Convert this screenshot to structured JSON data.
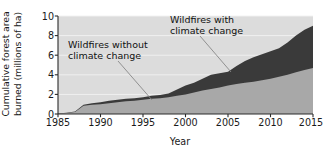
{
  "chart_data": {
    "type": "area",
    "title": "",
    "xlabel": "Year",
    "ylabel": "Cumulative forest area burned (millions of ha)",
    "xlim": [
      1985,
      2015
    ],
    "ylim": [
      0,
      10
    ],
    "xticks": [
      1985,
      1990,
      1995,
      2000,
      2005,
      2010,
      2015
    ],
    "yticks": [
      0,
      2,
      4,
      6,
      8,
      10
    ],
    "grid": true,
    "grid_orientation": "horizontal",
    "stacked": true,
    "legend_position": "annotations-inline",
    "x": [
      1985,
      1986,
      1987,
      1988,
      1989,
      1990,
      1991,
      1992,
      1993,
      1994,
      1995,
      1996,
      1997,
      1998,
      1999,
      2000,
      2001,
      2002,
      2003,
      2004,
      2005,
      2006,
      2007,
      2008,
      2009,
      2010,
      2011,
      2012,
      2013,
      2014,
      2015
    ],
    "series": [
      {
        "name": "Wildfires without climate change",
        "color": "#a8a8a8",
        "values": [
          0.05,
          0.1,
          0.2,
          0.85,
          0.95,
          1.0,
          1.1,
          1.2,
          1.3,
          1.35,
          1.45,
          1.55,
          1.6,
          1.7,
          1.85,
          2.0,
          2.2,
          2.4,
          2.55,
          2.7,
          2.9,
          3.05,
          3.2,
          3.3,
          3.45,
          3.6,
          3.8,
          4.0,
          4.25,
          4.5,
          4.7
        ]
      },
      {
        "name": "Wildfires with climate change",
        "color": "#3a3a3a",
        "values": [
          0.05,
          0.12,
          0.25,
          0.95,
          1.1,
          1.2,
          1.35,
          1.45,
          1.55,
          1.6,
          1.7,
          1.85,
          1.95,
          2.1,
          2.5,
          2.9,
          3.2,
          3.6,
          4.0,
          4.15,
          4.3,
          4.9,
          5.4,
          5.8,
          6.1,
          6.4,
          6.7,
          7.3,
          8.0,
          8.6,
          9.0
        ]
      }
    ]
  },
  "axes": {
    "ylabel_line1": "Cumulative forest area",
    "ylabel_line2": "burned (millions of ha)",
    "xlabel": "Year",
    "ytick_labels": [
      "10",
      "8",
      "6",
      "4",
      "2",
      "0"
    ],
    "xtick_labels": [
      "1985",
      "1990",
      "1995",
      "2000",
      "2005",
      "2010",
      "2015"
    ]
  },
  "annotations": {
    "without": {
      "line1": "Wildfires without",
      "line2": "climate change"
    },
    "with": {
      "line1": "Wildfires with",
      "line2": "climate change"
    }
  },
  "colors": {
    "plot_background": "#dcdcdc",
    "gridline": "#f2f2f2",
    "axis": "#2b2b2b",
    "series_without": "#a8a8a8",
    "series_with": "#3a3a3a",
    "leader_line": "#777777",
    "text": "#1a1a1a"
  }
}
